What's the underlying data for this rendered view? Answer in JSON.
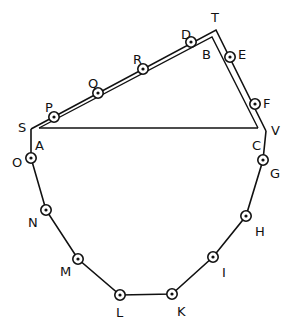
{
  "diagram": {
    "title": "",
    "colors": {
      "ink": "#111111",
      "background": "#ffffff"
    },
    "double_line_outer": [
      "S",
      "T",
      "V"
    ],
    "double_line_inner": [
      "A",
      "B",
      "C"
    ],
    "chord": [
      "A",
      "C"
    ],
    "corners": {
      "S": {
        "x": 31,
        "y": 129,
        "label": "S",
        "lx": 18,
        "ly": 128
      },
      "A": {
        "x": 39,
        "y": 128,
        "label": "A",
        "lx": 35,
        "ly": 146
      },
      "T": {
        "x": 216,
        "y": 30,
        "label": "T",
        "lx": 211,
        "ly": 18
      },
      "B": {
        "x": 212,
        "y": 37,
        "label": "B",
        "lx": 202,
        "ly": 55
      },
      "V": {
        "x": 266,
        "y": 131,
        "label": "V",
        "lx": 271,
        "ly": 131
      },
      "C": {
        "x": 258,
        "y": 128,
        "label": "C",
        "lx": 252,
        "ly": 146
      }
    },
    "upper_points": [
      {
        "label": "P",
        "x": 54,
        "y": 117,
        "lx": 45,
        "ly": 108
      },
      {
        "label": "Q",
        "x": 98,
        "y": 93,
        "lx": 88,
        "ly": 84
      },
      {
        "label": "R",
        "x": 143,
        "y": 69,
        "lx": 133,
        "ly": 60
      },
      {
        "label": "D",
        "x": 191,
        "y": 42,
        "lx": 181,
        "ly": 35
      },
      {
        "label": "E",
        "x": 230,
        "y": 57,
        "lx": 238,
        "ly": 55
      },
      {
        "label": "F",
        "x": 255,
        "y": 104,
        "lx": 263,
        "ly": 104
      }
    ],
    "lower_points": [
      {
        "label": "O",
        "x": 31,
        "y": 158,
        "lx": 12,
        "ly": 163
      },
      {
        "label": "N",
        "x": 46,
        "y": 210,
        "lx": 28,
        "ly": 223
      },
      {
        "label": "M",
        "x": 78,
        "y": 259,
        "lx": 60,
        "ly": 272
      },
      {
        "label": "L",
        "x": 120,
        "y": 295,
        "lx": 116,
        "ly": 313
      },
      {
        "label": "K",
        "x": 172,
        "y": 294,
        "lx": 177,
        "ly": 312
      },
      {
        "label": "I",
        "x": 213,
        "y": 257,
        "lx": 222,
        "ly": 273
      },
      {
        "label": "H",
        "x": 246,
        "y": 216,
        "lx": 255,
        "ly": 232
      },
      {
        "label": "G",
        "x": 263,
        "y": 160,
        "lx": 270,
        "ly": 174
      }
    ]
  }
}
